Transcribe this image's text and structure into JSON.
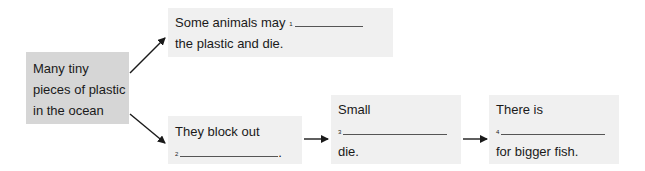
{
  "diagram": {
    "source": {
      "lines": [
        "Many tiny",
        "pieces of plastic",
        "in the ocean"
      ]
    },
    "box1": {
      "prefix": "Some animals may",
      "number": "1",
      "suffix_line": "the plastic and die."
    },
    "box2": {
      "line1": "They block out",
      "number": "2",
      "end": "."
    },
    "box3": {
      "line1": "Small",
      "number": "3",
      "line3": "die."
    },
    "box4": {
      "line1": "There is",
      "number": "4",
      "line3": "for bigger fish."
    },
    "colors": {
      "source_box": "#d6d6d6",
      "answer_box": "#f0f0f0",
      "arrow": "#1a1a1a",
      "blank_line": "#555555"
    }
  }
}
